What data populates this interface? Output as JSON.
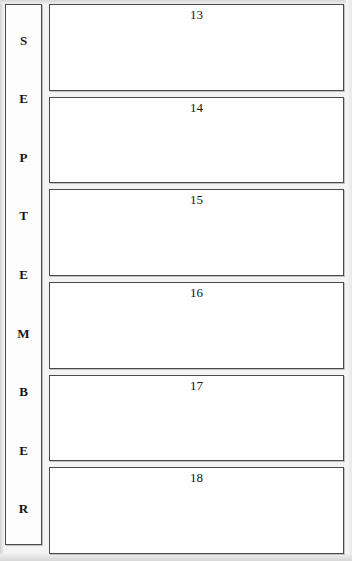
{
  "planner": {
    "month_spine": {
      "month_name": "SEPTEMBER",
      "letters": [
        "S",
        "E",
        "P",
        "T",
        "E",
        "M",
        "B",
        "E",
        "R"
      ]
    },
    "days": [
      {
        "number": "13"
      },
      {
        "number": "14"
      },
      {
        "number": "15"
      },
      {
        "number": "16"
      },
      {
        "number": "17"
      },
      {
        "number": "18"
      }
    ],
    "colors": {
      "page_background": "#f3f3f3",
      "box_fill": "#ffffff",
      "box_border": "#4a4a4a",
      "text": "#141414"
    }
  }
}
